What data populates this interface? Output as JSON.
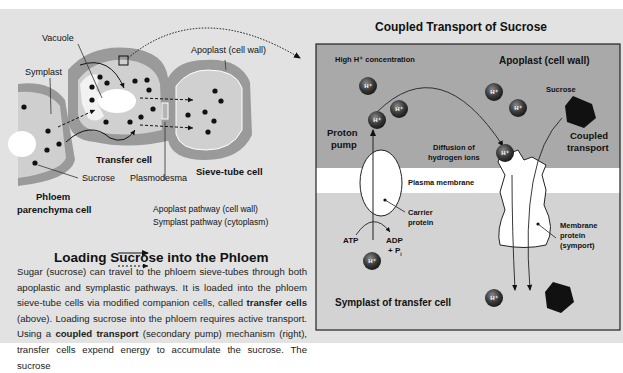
{
  "left_diagram": {
    "labels": {
      "vacuole": "Vacuole",
      "symplast": "Symplast",
      "apoplast": "Apoplast (cell wall)",
      "transfer_cell": "Transfer cell",
      "sucrose": "Sucrose",
      "plasmodesma": "Plasmodesma",
      "sieve_tube_cell": "Sieve-tube cell",
      "phloem_parenchyma_line1": "Phloem",
      "phloem_parenchyma_line2": "parenchyma cell"
    },
    "legend": [
      {
        "style": "solid-arrow",
        "label": "Apoplast pathway (cell wall)"
      },
      {
        "style": "dashed-arrow",
        "label": "Symplast pathway (cytoplasm)"
      }
    ]
  },
  "article": {
    "title": "Loading Sucrose into the Phloem",
    "p1": "Sugar (sucrose) can travel to the phloem sieve-tubes through both apoplastic and symplastic pathways. It is loaded into the phloem sieve-tube cells via modified companion cells, called ",
    "term1": "transfer cells",
    "p2": " (above). Loading sucrose into the phloem requires active transport. Using a ",
    "term2": "coupled transport",
    "p3": " (secondary pump) mechanism (right), transfer cells expend energy to accumulate the sucrose. The sucrose"
  },
  "right_diagram": {
    "title": "Coupled Transport of Sucrose",
    "labels": {
      "high_h": "High H⁺ concentration",
      "apoplast": "Apoplast (cell wall)",
      "sucrose": "Sucrose",
      "proton_pump_1": "Proton",
      "proton_pump_2": "pump",
      "diffusion_1": "Diffusion of",
      "diffusion_2": "hydrogen ions",
      "coupled_1": "Coupled",
      "coupled_2": "transport",
      "plasma_membrane": "Plasma membrane",
      "carrier_1": "Carrier",
      "carrier_2": "protein",
      "atp": "ATP",
      "adp": "ADP",
      "pi": "+ P",
      "pi_sub": "i",
      "membrane_protein_1": "Membrane",
      "membrane_protein_2": "protein",
      "membrane_protein_3": "(symport)",
      "symplast": "Symplast of transfer cell"
    },
    "ion_label": "H⁺",
    "colors": {
      "apoplast_region": "#a9a9a9",
      "membrane": "#ffffff",
      "symplast_region": "#d4d4d4",
      "ion": "#3a3a3a"
    }
  }
}
